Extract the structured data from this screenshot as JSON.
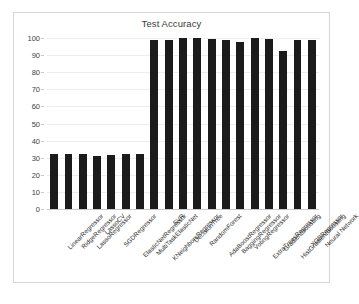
{
  "chart_data": {
    "type": "bar",
    "title": "Test Accuracy",
    "xlabel": "",
    "ylabel": "",
    "ylim": [
      0,
      100
    ],
    "yticks": [
      0,
      10,
      20,
      30,
      40,
      50,
      60,
      70,
      80,
      90,
      100
    ],
    "grid": true,
    "legend": "none",
    "bar_color": "#1b1b1b",
    "categories": [
      "LinearRegressor",
      "RidgeRegressor",
      "LassoRegressor",
      "LassoCV",
      "SGDRegressor",
      "ElasticNetRegressor",
      "MultiTaskElasticNet",
      "KNeighborsRegressor",
      "SVR",
      "DecisionTree",
      "RandomForest",
      "AdaBoostRegressor",
      "BaggingRegressor",
      "VotingRegressor",
      "ExtraTreesRegressor",
      "GradientBoosting",
      "HistGradientBoosting",
      "XGBRegressor",
      "Neural Network"
    ],
    "values": [
      32,
      32,
      32,
      31,
      31.5,
      32,
      32,
      99,
      99,
      100,
      100,
      99.5,
      99,
      97.5,
      100,
      99.5,
      92.5,
      99,
      99
    ]
  }
}
